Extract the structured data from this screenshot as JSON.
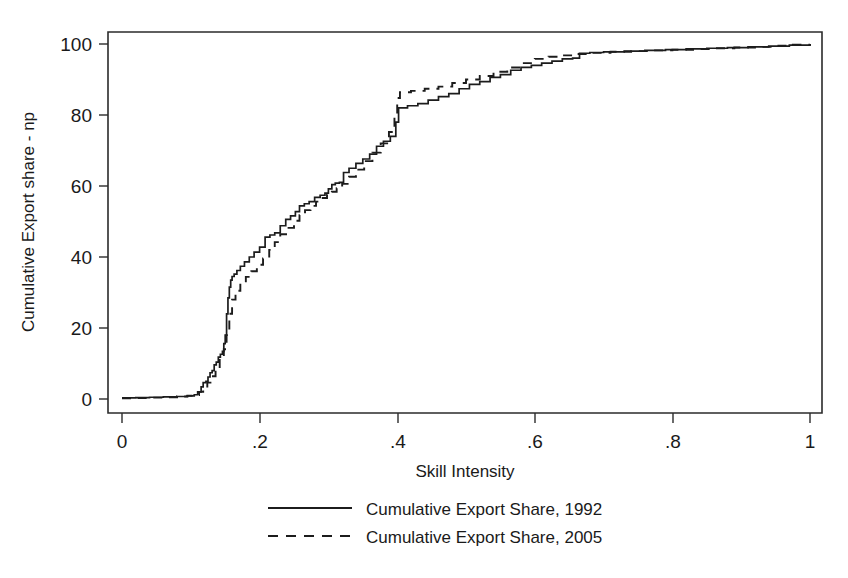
{
  "chart_data": {
    "type": "line",
    "title": "",
    "xlabel": "Skill Intensity",
    "ylabel": "Cumulative Export share - np",
    "xlim": [
      0,
      1
    ],
    "ylim": [
      0,
      100
    ],
    "grid": false,
    "legend_position": "below-plot",
    "xticks": [
      "0",
      ".2",
      ".4",
      ".6",
      ".8",
      "1"
    ],
    "xtick_values": [
      0,
      0.2,
      0.4,
      0.6,
      0.8,
      1
    ],
    "yticks": [
      "0",
      "20",
      "40",
      "60",
      "80",
      "100"
    ],
    "ytick_values": [
      0,
      20,
      40,
      60,
      80,
      100
    ],
    "series": [
      {
        "name": "Cumulative Export Share, 1992",
        "style": "solid",
        "color": "#1c1c1c",
        "x": [
          0.0,
          0.02,
          0.04,
          0.06,
          0.08,
          0.095,
          0.105,
          0.11,
          0.115,
          0.118,
          0.122,
          0.125,
          0.128,
          0.131,
          0.134,
          0.137,
          0.14,
          0.143,
          0.146,
          0.148,
          0.15,
          0.152,
          0.154,
          0.156,
          0.158,
          0.16,
          0.163,
          0.167,
          0.172,
          0.178,
          0.185,
          0.192,
          0.2,
          0.208,
          0.215,
          0.222,
          0.23,
          0.238,
          0.245,
          0.252,
          0.258,
          0.265,
          0.272,
          0.28,
          0.288,
          0.295,
          0.3,
          0.305,
          0.31,
          0.316,
          0.322,
          0.33,
          0.34,
          0.35,
          0.36,
          0.37,
          0.38,
          0.39,
          0.398,
          0.402,
          0.415,
          0.43,
          0.445,
          0.46,
          0.475,
          0.49,
          0.505,
          0.52,
          0.535,
          0.55,
          0.565,
          0.58,
          0.595,
          0.61,
          0.625,
          0.64,
          0.655,
          0.665,
          0.68,
          0.7,
          0.73,
          0.76,
          0.79,
          0.82,
          0.85,
          0.88,
          0.91,
          0.94,
          0.97,
          1.0
        ],
        "y": [
          0.3,
          0.4,
          0.5,
          0.6,
          0.7,
          0.9,
          1.2,
          2.0,
          3.4,
          4.6,
          5.0,
          6.2,
          7.4,
          8.0,
          9.6,
          10.4,
          11.8,
          12.6,
          13.4,
          15.6,
          18.0,
          24.0,
          28.5,
          31.5,
          33.5,
          34.5,
          35.2,
          36.2,
          37.4,
          38.6,
          40.0,
          41.4,
          42.8,
          45.6,
          46.2,
          46.8,
          48.8,
          50.6,
          51.6,
          52.8,
          54.4,
          55.0,
          55.6,
          56.8,
          57.4,
          58.0,
          59.2,
          60.4,
          60.8,
          61.0,
          63.8,
          65.0,
          66.4,
          67.6,
          69.0,
          71.2,
          72.6,
          74.0,
          78.0,
          82.0,
          82.6,
          83.2,
          84.2,
          85.2,
          86.0,
          87.4,
          88.6,
          89.4,
          90.6,
          91.4,
          92.6,
          93.4,
          94.0,
          94.6,
          95.2,
          95.8,
          96.0,
          97.4,
          97.6,
          97.8,
          98.0,
          98.2,
          98.4,
          98.6,
          98.8,
          99.0,
          99.2,
          99.4,
          99.7,
          100.0
        ]
      },
      {
        "name": "Cumulative Export Share, 2005",
        "style": "dashed",
        "color": "#1c1c1c",
        "x": [
          0.0,
          0.02,
          0.04,
          0.06,
          0.08,
          0.095,
          0.105,
          0.112,
          0.118,
          0.124,
          0.13,
          0.136,
          0.142,
          0.148,
          0.152,
          0.156,
          0.16,
          0.165,
          0.172,
          0.18,
          0.188,
          0.196,
          0.205,
          0.214,
          0.222,
          0.23,
          0.24,
          0.25,
          0.258,
          0.266,
          0.274,
          0.282,
          0.29,
          0.298,
          0.305,
          0.312,
          0.32,
          0.33,
          0.34,
          0.352,
          0.364,
          0.376,
          0.388,
          0.396,
          0.4,
          0.404,
          0.42,
          0.44,
          0.46,
          0.48,
          0.5,
          0.52,
          0.54,
          0.56,
          0.58,
          0.6,
          0.62,
          0.64,
          0.66,
          0.68,
          0.71,
          0.74,
          0.77,
          0.8,
          0.83,
          0.86,
          0.89,
          0.92,
          0.95,
          0.975,
          1.0
        ],
        "y": [
          0.2,
          0.3,
          0.4,
          0.5,
          0.7,
          0.9,
          1.1,
          2.0,
          3.2,
          4.6,
          6.4,
          8.4,
          11.0,
          14.0,
          18.0,
          24.0,
          28.0,
          30.5,
          32.6,
          34.4,
          36.0,
          37.8,
          39.6,
          42.0,
          44.2,
          46.4,
          48.2,
          50.2,
          51.8,
          53.2,
          54.4,
          55.6,
          56.6,
          57.6,
          58.4,
          59.4,
          60.6,
          62.6,
          64.6,
          67.0,
          69.4,
          72.0,
          75.2,
          80.0,
          84.8,
          86.4,
          86.8,
          87.4,
          88.0,
          89.0,
          90.0,
          91.0,
          92.2,
          93.4,
          94.6,
          95.8,
          96.4,
          96.8,
          97.2,
          97.5,
          97.8,
          98.0,
          98.2,
          98.4,
          98.6,
          98.8,
          99.0,
          99.2,
          99.5,
          99.8,
          100.0
        ]
      }
    ]
  },
  "axes": {
    "y_title": "Cumulative Export share - np",
    "x_title": "Skill Intensity",
    "y_ticks": [
      "100",
      "80",
      "60",
      "40",
      "20",
      "0"
    ],
    "x_ticks": [
      "0",
      ".2",
      ".4",
      ".6",
      ".8",
      "1"
    ]
  },
  "legend": {
    "entries": [
      {
        "label": "Cumulative Export Share, 1992",
        "style": "solid"
      },
      {
        "label": "Cumulative Export Share, 2005",
        "style": "dashed"
      }
    ]
  }
}
